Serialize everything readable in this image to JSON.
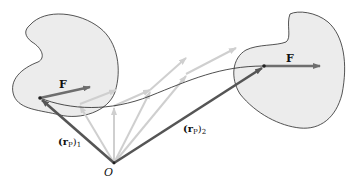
{
  "diagram": {
    "type": "rigid-body-force-translation",
    "colors": {
      "background": "#ffffff",
      "body_fill": "#ececec",
      "body_stroke": "#2a2a2a",
      "path_stroke": "#222222",
      "position_vector": "#555555",
      "force_vector": "#6e6e6e",
      "ghost_vector": "#cfcfcf",
      "point": "#222222",
      "text": "#111111"
    },
    "labels": {
      "force_1": "F",
      "force_2": "F",
      "origin": "O",
      "position_1_main": "(r",
      "position_1_sub_p": "P",
      "position_1_close": ")",
      "position_1_index": "1",
      "position_2_main": "(r",
      "position_2_sub_p": "P",
      "position_2_close": ")",
      "position_2_index": "2"
    }
  }
}
